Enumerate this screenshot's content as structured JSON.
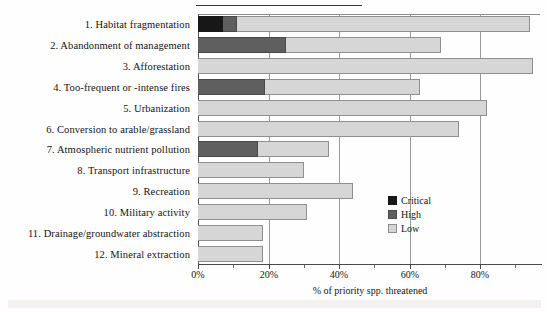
{
  "figure": {
    "background_color": "#fefefe",
    "has_top_rule": true,
    "has_bottom_scan_band": true
  },
  "colors": {
    "critical": "#171717",
    "high": "#5f5f5f",
    "low": "#d6d6d6",
    "axis": "#4a4a4a",
    "gridline": "#9a9a9a",
    "text": "#141414"
  },
  "legend": {
    "position": "inside-right",
    "items": [
      {
        "label": "Critical",
        "color": "#171717"
      },
      {
        "label": "High",
        "color": "#5f5f5f"
      },
      {
        "label": "Low",
        "color": "#d6d6d6"
      }
    ]
  },
  "axis": {
    "x_title": "% of priority spp. threatened",
    "x_ticks": [
      "0%",
      "20%",
      "40%",
      "60%",
      "80%"
    ],
    "x_tick_values": [
      0,
      20,
      40,
      60,
      80
    ],
    "x_minor_tick_values": [
      10,
      30,
      50,
      70,
      90
    ],
    "xlim": [
      0,
      97
    ],
    "grid": "vertical"
  },
  "chart_data": {
    "type": "bar",
    "orientation": "horizontal",
    "stacked": true,
    "title": "",
    "subtitle": "",
    "xlabel": "% of priority spp. threatened",
    "ylabel": "",
    "xlim": [
      0,
      97
    ],
    "xticks": [
      0,
      20,
      40,
      60,
      80
    ],
    "xtick_labels": [
      "0%",
      "20%",
      "40%",
      "60%",
      "80%"
    ],
    "grid": true,
    "legend_position": "inside-right",
    "categories": [
      "1. Habitat fragmentation",
      "2. Abandonment of management",
      "3. Afforestation",
      "4. Too-frequent or -intense fires",
      "5. Urbanization",
      "6. Conversion to arable/grassland",
      "7. Atmospheric nutrient pollution",
      "8. Transport infrastructure",
      "9. Recreation",
      "10. Military activity",
      "11. Drainage/groundwater abstraction",
      "12. Mineral extraction"
    ],
    "series": [
      {
        "name": "Critical",
        "color": "#171717",
        "values": [
          7,
          0,
          0,
          0,
          0,
          0,
          0,
          0,
          0,
          0,
          0,
          0
        ]
      },
      {
        "name": "High",
        "color": "#5f5f5f",
        "values": [
          4,
          25,
          0,
          19,
          0,
          0,
          17,
          0,
          0,
          0,
          0,
          0
        ]
      },
      {
        "name": "Low",
        "color": "#d6d6d6",
        "values": [
          83,
          44,
          95,
          44,
          82,
          74,
          20,
          30,
          44,
          31,
          18.5,
          18.5
        ]
      }
    ],
    "totals": [
      94,
      69,
      95,
      63,
      82,
      74,
      37,
      30,
      44,
      31,
      18.5,
      18.5
    ]
  }
}
